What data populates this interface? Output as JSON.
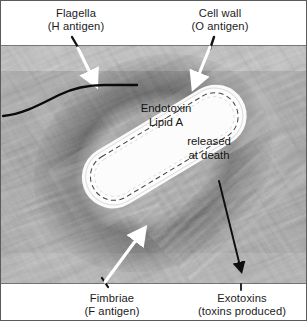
{
  "figure": {
    "type": "labeled-electron-micrograph",
    "background_color": "#ffffff",
    "border_color": "#5b5b5b",
    "photo_tone": "grayscale"
  },
  "labels": {
    "flagella": {
      "line1": "Flagella",
      "line2": "(H antigen)"
    },
    "cell_wall": {
      "line1": "Cell wall",
      "line2": "(O antigen)"
    },
    "fimbriae": {
      "line1": "Fimbriae",
      "line2": "(F antigen)"
    },
    "exotoxins": {
      "line1": "Exotoxins",
      "line2": "(toxins produced)"
    }
  },
  "cell_annotations": {
    "endotoxin_line1": "Endotoxin",
    "endotoxin_line2": "Lipid A",
    "released_line1": "released",
    "released_line2": "at death"
  },
  "leaders": {
    "flagella_arrow": "white-arrow-down-right",
    "cell_wall_arrow": "white-arrow-down-left",
    "fimbriae_arrow": "white-arrow-up-right",
    "exotoxins_arrow": "black-arrow-down-right",
    "flagellum_trace": "black-curved-line"
  },
  "colors": {
    "text": "#1b1b1b",
    "white_arrow": "#ffffff",
    "black_arrow": "#0e0e0e",
    "cell_fill": "#fbfbfb"
  }
}
